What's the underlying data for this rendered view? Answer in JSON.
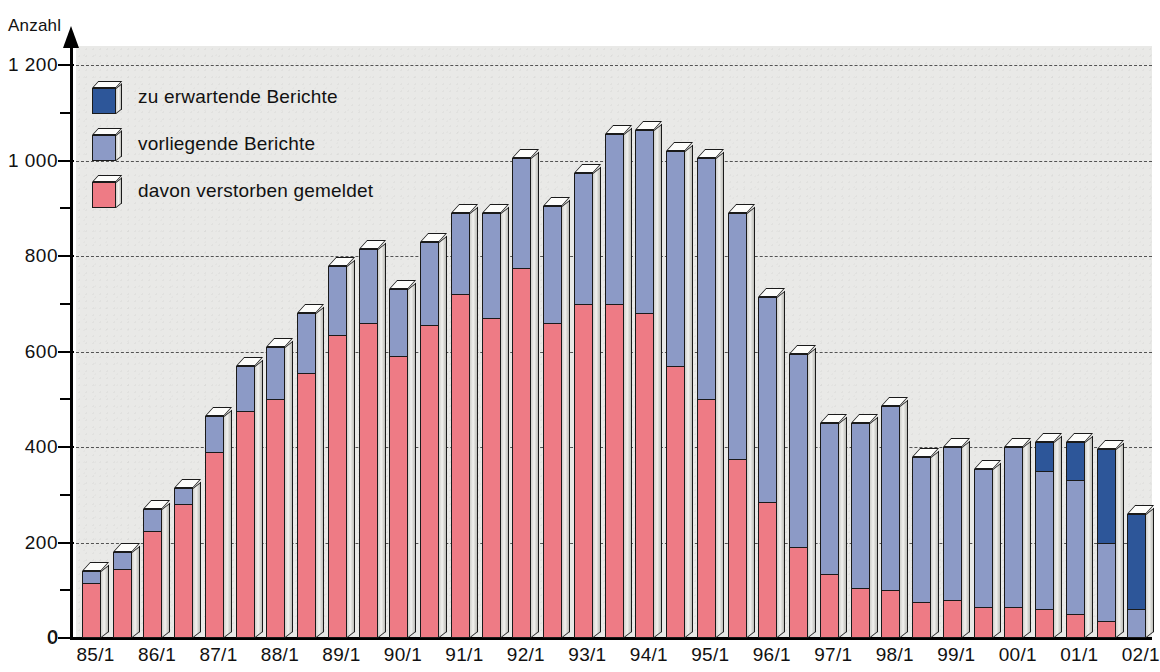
{
  "chart_data": {
    "type": "bar",
    "stacked": true,
    "title": "",
    "subtitle": "",
    "ylabel": "Anzahl",
    "xlabel": "",
    "ylim": [
      0,
      1240
    ],
    "ytick_values": [
      0,
      200,
      400,
      600,
      800,
      1000,
      1200
    ],
    "ytick_labels": [
      "0",
      "200",
      "400",
      "600",
      "800",
      "1 000",
      "1 200"
    ],
    "yminor_values": [
      100,
      300,
      500,
      700,
      900,
      1100
    ],
    "grid": true,
    "grid_style": "dashed-horizontal",
    "legend_position": "top-left",
    "legend": [
      {
        "name": "zu erwartende Berichte",
        "color": "#2d5699"
      },
      {
        "name": "vorliegende Berichte",
        "color": "#8c9ac6"
      },
      {
        "name": "davon verstorben gemeldet",
        "color": "#ee7b85"
      }
    ],
    "categories": [
      "85/1",
      "85/2",
      "86/1",
      "86/2",
      "87/1",
      "87/2",
      "88/1",
      "88/2",
      "89/1",
      "89/2",
      "90/1",
      "90/2",
      "91/1",
      "91/2",
      "92/1",
      "92/2",
      "93/1",
      "93/2",
      "94/1",
      "94/2",
      "95/1",
      "95/2",
      "96/1",
      "96/2",
      "97/1",
      "97/2",
      "98/1",
      "98/2",
      "99/1",
      "99/2",
      "00/1",
      "00/2",
      "01/1",
      "01/2",
      "02/1"
    ],
    "xtick_labels": [
      "85/1",
      "86/1",
      "87/1",
      "88/1",
      "89/1",
      "90/1",
      "91/1",
      "92/1",
      "93/1",
      "94/1",
      "95/1",
      "96/1",
      "97/1",
      "98/1",
      "99/1",
      "00/1",
      "01/1",
      "02/1"
    ],
    "xtick_category_index": [
      0,
      2,
      4,
      6,
      8,
      10,
      12,
      14,
      16,
      18,
      20,
      22,
      24,
      26,
      28,
      30,
      32,
      34
    ],
    "series": [
      {
        "name": "davon verstorben gemeldet",
        "color": "#ee7b85",
        "values": [
          115,
          145,
          225,
          280,
          390,
          475,
          500,
          555,
          635,
          660,
          590,
          655,
          720,
          670,
          775,
          660,
          700,
          700,
          680,
          570,
          500,
          375,
          285,
          190,
          135,
          105,
          100,
          75,
          80,
          65,
          65,
          60,
          50,
          35,
          0
        ]
      },
      {
        "name": "vorliegende Berichte",
        "color": "#8c9ac6",
        "values": [
          25,
          35,
          45,
          35,
          75,
          95,
          110,
          125,
          145,
          155,
          140,
          175,
          170,
          220,
          230,
          245,
          275,
          355,
          385,
          450,
          505,
          515,
          430,
          405,
          315,
          345,
          385,
          305,
          320,
          290,
          335,
          290,
          280,
          165,
          60
        ]
      },
      {
        "name": "zu erwartende Berichte",
        "color": "#2d5699",
        "values": [
          0,
          0,
          0,
          0,
          0,
          0,
          0,
          0,
          0,
          0,
          0,
          0,
          0,
          0,
          0,
          0,
          0,
          0,
          0,
          0,
          0,
          0,
          0,
          0,
          0,
          0,
          0,
          0,
          0,
          0,
          0,
          60,
          80,
          195,
          200
        ]
      }
    ],
    "totals": [
      140,
      180,
      270,
      315,
      465,
      570,
      610,
      680,
      780,
      815,
      730,
      830,
      890,
      890,
      1005,
      905,
      975,
      1055,
      1065,
      1020,
      1005,
      890,
      715,
      595,
      450,
      450,
      485,
      380,
      400,
      355,
      400,
      410,
      410,
      395,
      260
    ]
  },
  "axis": {
    "y_title": "Anzahl"
  }
}
